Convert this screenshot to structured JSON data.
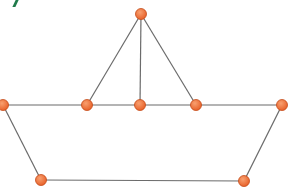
{
  "diagram": {
    "type": "graph",
    "colors": {
      "node_fill": "#e8622a",
      "node_highlight": "#f8a070",
      "node_stroke": "#c44a18",
      "edge": "#6b6b6b",
      "corner_mark": "#1f7a4a"
    },
    "node_radius": 5.5,
    "nodes": [
      {
        "id": "top",
        "x": 141,
        "y": 14
      },
      {
        "id": "hull-left",
        "x": 3,
        "y": 105
      },
      {
        "id": "mid-left",
        "x": 87,
        "y": 105
      },
      {
        "id": "mid-center",
        "x": 140,
        "y": 105
      },
      {
        "id": "mid-right",
        "x": 196,
        "y": 105
      },
      {
        "id": "hull-right",
        "x": 282,
        "y": 105
      },
      {
        "id": "bottom-left",
        "x": 41,
        "y": 180
      },
      {
        "id": "bottom-right",
        "x": 244,
        "y": 181
      }
    ],
    "edges": [
      [
        "top",
        "mid-left"
      ],
      [
        "top",
        "mid-center"
      ],
      [
        "top",
        "mid-right"
      ],
      [
        "hull-left",
        "mid-left"
      ],
      [
        "mid-left",
        "mid-center"
      ],
      [
        "mid-center",
        "mid-right"
      ],
      [
        "mid-right",
        "hull-right"
      ],
      [
        "hull-left",
        "bottom-left"
      ],
      [
        "bottom-left",
        "bottom-right"
      ],
      [
        "bottom-right",
        "hull-right"
      ]
    ]
  }
}
